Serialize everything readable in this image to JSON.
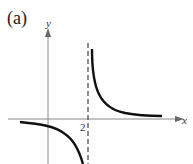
{
  "figure": {
    "panel_label": "(a)",
    "x_axis_label": "x",
    "y_axis_label": "y",
    "asymptote_tick_label": "2",
    "colors": {
      "axes": "#888888",
      "curve": "#111111",
      "asymptote": "#444444"
    }
  },
  "graph": {
    "type": "rational-function-sketch",
    "vertical_asymptote": 2,
    "horizontal_asymptote": 0,
    "branches": [
      "left branch below x-axis, decreasing to -inf as x->2-",
      "right branch above x-axis, decreasing from +inf as x->2+"
    ]
  }
}
